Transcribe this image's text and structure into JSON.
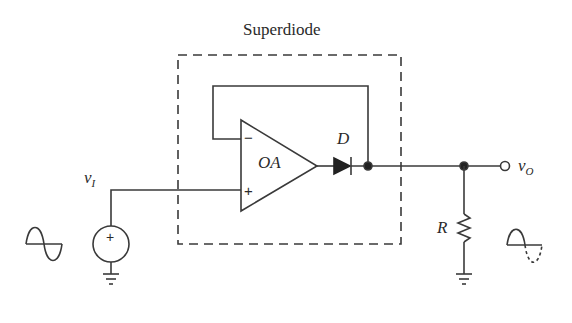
{
  "title": "Superdiode",
  "components": {
    "opamp": {
      "label": "OA",
      "minus_sign": "−",
      "plus_sign": "+"
    },
    "diode": {
      "label": "D"
    },
    "resistor": {
      "label": "R"
    },
    "source": {
      "sign": "+"
    }
  },
  "labels": {
    "input": {
      "main": "v",
      "sub": "I"
    },
    "output": {
      "main": "v",
      "sub": "O"
    }
  },
  "waveforms": {
    "input": "full sine wave",
    "output": "half-wave rectified sine (negative half dashed)"
  },
  "colors": {
    "line": "#3a3a3a",
    "background": "#ffffff"
  }
}
